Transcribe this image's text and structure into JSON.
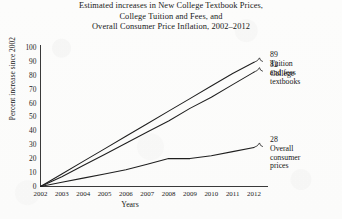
{
  "chart_data": {
    "type": "line",
    "title": "Estimated increases in New College Textbook Prices, College Tuition and Fees, and Overall Consumer Price Inflation, 2002–2012",
    "title_lines": [
      "Estimated increases in New College Textbook Prices,",
      "College Tuition and Fees, and",
      "Overall Consumer Price Inflation, 2002–2012"
    ],
    "xlabel": "Years",
    "ylabel": "Percent increase since 2002",
    "x": [
      2002,
      2003,
      2004,
      2005,
      2006,
      2007,
      2008,
      2009,
      2010,
      2011,
      2012
    ],
    "xtick_labels": [
      "2002",
      "2003",
      "2004",
      "2005",
      "2006",
      "2007",
      "2008",
      "2009",
      "2010",
      "2011",
      "2012"
    ],
    "ytick_labels": [
      "0",
      "10",
      "20",
      "30",
      "40",
      "50",
      "60",
      "70",
      "80",
      "90",
      "100"
    ],
    "ytick_values": [
      0,
      10,
      20,
      30,
      40,
      50,
      60,
      70,
      80,
      90,
      100
    ],
    "ylim": [
      0,
      100
    ],
    "xlim": [
      2002,
      2012
    ],
    "grid": false,
    "legend": "none",
    "series": [
      {
        "name": "Tuition and fees",
        "end_value": 89,
        "end_label": "89",
        "label_lines": [
          "Tuition",
          "and fees"
        ],
        "values": [
          0,
          9,
          18,
          27,
          36,
          45,
          54,
          63,
          72,
          81,
          89
        ]
      },
      {
        "name": "College textbooks",
        "end_value": 82,
        "end_label": "82",
        "label_lines": [
          "College",
          "textbooks"
        ],
        "values": [
          0,
          7,
          15,
          23,
          31,
          39,
          47,
          56,
          64,
          73,
          82
        ]
      },
      {
        "name": "Overall consumer prices",
        "end_value": 28,
        "end_label": "28",
        "label_lines": [
          "Overall",
          "consumer",
          "prices"
        ],
        "values": [
          0,
          3,
          6,
          9,
          12,
          16,
          20,
          20,
          22,
          25,
          28
        ]
      }
    ],
    "colors": {
      "line": "#1f1f1f",
      "axis": "#3a3a3a",
      "background": "#fdfdfc",
      "text": "#151515"
    }
  }
}
